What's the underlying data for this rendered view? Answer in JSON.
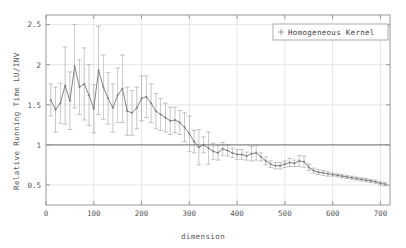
{
  "chart_data": {
    "type": "line",
    "title": "",
    "xlabel": "dimension",
    "ylabel": "Relative Running Time LU/INV",
    "xlim": [
      0,
      720
    ],
    "ylim": [
      0.25,
      2.62
    ],
    "xticks": [
      0,
      100,
      200,
      300,
      400,
      500,
      600,
      700
    ],
    "yticks": [
      0.5,
      1,
      1.5,
      2,
      2.5
    ],
    "grid": true,
    "legend_position": "top-right",
    "reference_line_y": 1,
    "series": [
      {
        "name": "Homogeneous Kernel",
        "marker": "errorbar-plus",
        "color": "#777777",
        "x": [
          10,
          20,
          30,
          40,
          50,
          60,
          70,
          80,
          90,
          100,
          110,
          120,
          130,
          140,
          150,
          160,
          170,
          180,
          190,
          200,
          210,
          220,
          230,
          240,
          250,
          260,
          270,
          280,
          290,
          300,
          310,
          320,
          330,
          340,
          350,
          360,
          370,
          380,
          390,
          400,
          410,
          420,
          430,
          440,
          450,
          460,
          470,
          480,
          490,
          500,
          510,
          520,
          530,
          540,
          550,
          560,
          570,
          580,
          590,
          600,
          610,
          620,
          630,
          640,
          650,
          660,
          670,
          680,
          690,
          700,
          710
        ],
        "y": [
          1.56,
          1.44,
          1.52,
          1.74,
          1.55,
          1.98,
          1.72,
          1.76,
          1.62,
          1.45,
          1.93,
          1.72,
          1.58,
          1.46,
          1.62,
          1.7,
          1.42,
          1.4,
          1.46,
          1.58,
          1.6,
          1.52,
          1.42,
          1.38,
          1.34,
          1.3,
          1.31,
          1.28,
          1.22,
          1.14,
          1.04,
          0.97,
          1.0,
          0.96,
          0.92,
          0.9,
          0.95,
          0.93,
          0.9,
          0.88,
          0.88,
          0.86,
          0.89,
          0.9,
          0.85,
          0.8,
          0.76,
          0.74,
          0.74,
          0.76,
          0.78,
          0.77,
          0.8,
          0.79,
          0.72,
          0.68,
          0.66,
          0.65,
          0.64,
          0.63,
          0.62,
          0.61,
          0.6,
          0.59,
          0.58,
          0.57,
          0.56,
          0.55,
          0.54,
          0.52,
          0.51
        ],
        "yerr": [
          0.2,
          0.28,
          0.25,
          0.48,
          0.36,
          0.52,
          0.34,
          0.45,
          0.38,
          0.3,
          0.55,
          0.4,
          0.32,
          0.3,
          0.34,
          0.42,
          0.3,
          0.28,
          0.26,
          0.28,
          0.26,
          0.24,
          0.22,
          0.2,
          0.18,
          0.17,
          0.16,
          0.15,
          0.18,
          0.22,
          0.14,
          0.22,
          0.1,
          0.2,
          0.1,
          0.09,
          0.08,
          0.07,
          0.06,
          0.06,
          0.06,
          0.05,
          0.09,
          0.09,
          0.05,
          0.05,
          0.04,
          0.04,
          0.04,
          0.04,
          0.05,
          0.04,
          0.07,
          0.07,
          0.04,
          0.03,
          0.03,
          0.03,
          0.03,
          0.02,
          0.02,
          0.02,
          0.02,
          0.02,
          0.02,
          0.02,
          0.02,
          0.02,
          0.02,
          0.02,
          0.02
        ]
      }
    ]
  },
  "legend": {
    "entries": [
      {
        "label": "Homogeneous Kernel"
      }
    ]
  },
  "axes": {
    "x_title": "dimension",
    "y_title": "Relative Running Time LU/INV",
    "x_tick_labels": [
      "0",
      "100",
      "200",
      "300",
      "400",
      "500",
      "600",
      "700"
    ],
    "y_tick_labels": [
      "0.5",
      "1",
      "1.5",
      "2",
      "2.5"
    ]
  },
  "colors": {
    "series": "#777777",
    "frame": "#9a9a9a",
    "grid": "#dcdcdc",
    "reference_line": "#8a8a8a",
    "text": "#555555",
    "background": "#ffffff"
  }
}
